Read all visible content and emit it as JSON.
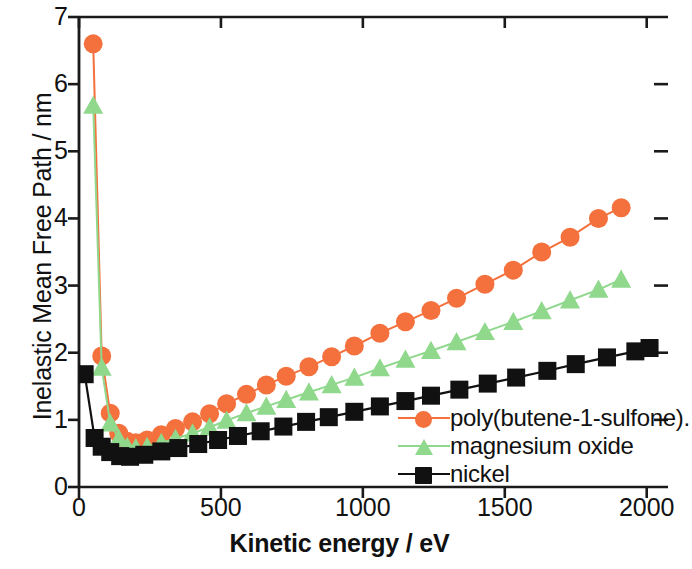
{
  "chart_data": {
    "type": "line",
    "title": "",
    "xlabel": "Kinetic energy / eV",
    "ylabel": "Inelastic Mean Free Path / nm",
    "xlim": [
      0,
      2075
    ],
    "ylim": [
      0,
      7
    ],
    "xticks": [
      0,
      500,
      1000,
      1500,
      2000
    ],
    "xtick_labels": [
      "0",
      "500",
      "1000",
      "1500",
      "2000"
    ],
    "yticks": [
      0,
      1,
      2,
      3,
      4,
      5,
      6,
      7
    ],
    "ytick_labels": [
      "0",
      "1",
      "2",
      "3",
      "4",
      "5",
      "6",
      "7"
    ],
    "grid": false,
    "legend_position": "lower right",
    "series": [
      {
        "name": "poly(butene-1-sulfone).",
        "color": "#F4703C",
        "marker": "circle",
        "x": [
          50,
          80,
          110,
          140,
          170,
          200,
          240,
          290,
          340,
          400,
          460,
          520,
          590,
          660,
          730,
          810,
          890,
          970,
          1060,
          1150,
          1240,
          1330,
          1430,
          1530,
          1630,
          1730,
          1830,
          1910
        ],
        "y": [
          6.6,
          1.95,
          1.1,
          0.8,
          0.68,
          0.66,
          0.7,
          0.78,
          0.87,
          0.97,
          1.09,
          1.24,
          1.38,
          1.52,
          1.65,
          1.79,
          1.94,
          2.1,
          2.29,
          2.46,
          2.63,
          2.81,
          3.02,
          3.23,
          3.5,
          3.72,
          4.0,
          4.16
        ]
      },
      {
        "name": "magnesium oxide",
        "color": "#8FD88C",
        "marker": "triangle",
        "x": [
          50,
          80,
          110,
          140,
          170,
          200,
          240,
          290,
          340,
          400,
          460,
          520,
          590,
          660,
          730,
          810,
          890,
          970,
          1060,
          1150,
          1240,
          1330,
          1430,
          1530,
          1630,
          1730,
          1830,
          1910
        ],
        "y": [
          5.68,
          1.78,
          0.95,
          0.72,
          0.6,
          0.58,
          0.6,
          0.66,
          0.72,
          0.8,
          0.89,
          0.99,
          1.1,
          1.2,
          1.3,
          1.41,
          1.52,
          1.63,
          1.77,
          1.9,
          2.03,
          2.16,
          2.31,
          2.46,
          2.62,
          2.78,
          2.94,
          3.09
        ]
      },
      {
        "name": "nickel",
        "color": "#111111",
        "marker": "square",
        "x": [
          20,
          55,
          80,
          110,
          145,
          180,
          230,
          290,
          350,
          420,
          490,
          560,
          640,
          720,
          800,
          880,
          970,
          1060,
          1150,
          1240,
          1340,
          1440,
          1540,
          1650,
          1750,
          1860,
          1960,
          2010
        ],
        "y": [
          1.68,
          0.73,
          0.6,
          0.52,
          0.46,
          0.45,
          0.48,
          0.53,
          0.58,
          0.64,
          0.7,
          0.76,
          0.83,
          0.9,
          0.97,
          1.04,
          1.12,
          1.2,
          1.28,
          1.36,
          1.45,
          1.54,
          1.63,
          1.73,
          1.83,
          1.93,
          2.02,
          2.07
        ]
      }
    ]
  },
  "axes": {
    "frame_color": "#1a1a1a"
  },
  "legend": {
    "items": [
      {
        "label": "poly(butene-1-sulfone).",
        "marker": "circle-marker",
        "color": "#F4703C"
      },
      {
        "label": "magnesium oxide",
        "marker": "triangle-marker",
        "color": "#8FD88C"
      },
      {
        "label": "nickel",
        "marker": "square-marker",
        "color": "#111111"
      }
    ]
  }
}
